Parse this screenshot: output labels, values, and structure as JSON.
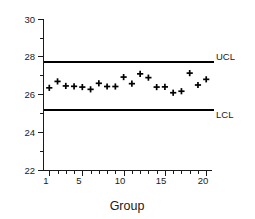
{
  "chart_data": {
    "type": "scatter",
    "title": "",
    "subtitle": "",
    "xlabel": "Group",
    "ylabel": "",
    "xlim": [
      0.3,
      20.7
    ],
    "ylim": [
      22,
      30
    ],
    "grid": false,
    "legend_position": "none",
    "marker": "plus",
    "x": [
      1,
      2,
      3,
      4,
      5,
      6,
      7,
      8,
      9,
      10,
      11,
      12,
      13,
      14,
      15,
      16,
      17,
      18,
      19,
      20
    ],
    "categories": [
      "1",
      "2",
      "3",
      "4",
      "5",
      "6",
      "7",
      "8",
      "9",
      "10",
      "11",
      "12",
      "13",
      "14",
      "15",
      "16",
      "17",
      "18",
      "19",
      "20"
    ],
    "series": [
      {
        "name": "Sample mean",
        "values": [
          26.38,
          26.72,
          26.48,
          26.46,
          26.42,
          26.3,
          26.62,
          26.45,
          26.45,
          26.95,
          26.6,
          27.12,
          26.92,
          26.42,
          26.43,
          26.12,
          26.2,
          27.16,
          26.53,
          26.83
        ]
      }
    ],
    "reference_lines": [
      {
        "name": "UCL",
        "label": "UCL",
        "value": 27.78
      },
      {
        "name": "LCL",
        "label": "LCL",
        "value": 25.28
      }
    ],
    "y_ticks_major": [
      22,
      24,
      26,
      28,
      30
    ],
    "y_tick_labels": [
      "22",
      "24",
      "26",
      "28",
      "30"
    ],
    "y_ticks_minor": [
      23,
      25,
      27,
      29
    ],
    "x_ticks_major": [
      1,
      5,
      10,
      15,
      20
    ],
    "x_tick_labels": [
      "1",
      "5",
      "10",
      "15",
      "20"
    ],
    "x_ticks_all": [
      1,
      2,
      3,
      4,
      5,
      6,
      7,
      8,
      9,
      10,
      11,
      12,
      13,
      14,
      15,
      16,
      17,
      18,
      19,
      20
    ]
  },
  "colors": {
    "axis": "#1a1a1a",
    "limit_line": "#000000",
    "marker": "#000000",
    "background": "#ffffff"
  },
  "labels": {
    "ucl": "UCL",
    "lcl": "LCL",
    "x_axis_title": "Group",
    "y_30": "30",
    "y_28": "28",
    "y_26": "26",
    "y_24": "24",
    "y_22": "22",
    "x_1": "1",
    "x_5": "5",
    "x_10": "10",
    "x_15": "15",
    "x_20": "20"
  }
}
